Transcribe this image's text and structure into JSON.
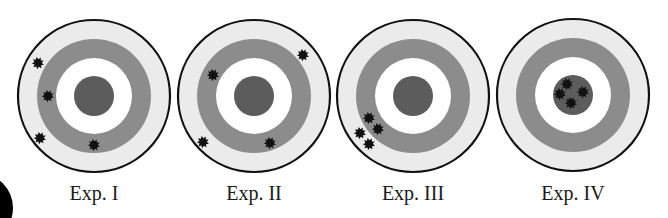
{
  "figure": {
    "title": "",
    "colors": {
      "outer_ring": "#ebebeb",
      "mid_ring": "#8c8c8c",
      "inner_ring": "#ffffff",
      "bullseye": "#5c5c5c",
      "outline": "#111111",
      "hole": "#111111",
      "corner_blob": "#000000"
    },
    "ring_radii": {
      "outer": 76,
      "mid_outer": 57,
      "mid_inner": 38,
      "bullseye": 20
    },
    "corner_blob": {
      "cx": -22,
      "cy": 208,
      "r": 35
    }
  },
  "targets": [
    {
      "label": "Exp. I",
      "cx": 94,
      "cy": 96,
      "holes": [
        {
          "x": 38,
          "y": 63
        },
        {
          "x": 48,
          "y": 96
        },
        {
          "x": 40,
          "y": 138
        },
        {
          "x": 94,
          "y": 145
        }
      ]
    },
    {
      "label": "Exp. II",
      "cx": 254,
      "cy": 96,
      "holes": [
        {
          "x": 213,
          "y": 75
        },
        {
          "x": 303,
          "y": 55
        },
        {
          "x": 203,
          "y": 142
        },
        {
          "x": 270,
          "y": 143
        }
      ]
    },
    {
      "label": "Exp. III",
      "cx": 413,
      "cy": 96,
      "holes": [
        {
          "x": 369,
          "y": 118
        },
        {
          "x": 378,
          "y": 129
        },
        {
          "x": 360,
          "y": 133
        },
        {
          "x": 369,
          "y": 144
        }
      ]
    },
    {
      "label": "Exp. IV",
      "cx": 573,
      "cy": 95,
      "holes": [
        {
          "x": 567,
          "y": 84
        },
        {
          "x": 583,
          "y": 92
        },
        {
          "x": 560,
          "y": 94
        },
        {
          "x": 571,
          "y": 103
        }
      ]
    }
  ]
}
